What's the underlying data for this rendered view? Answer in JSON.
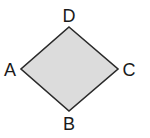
{
  "figure": {
    "shape": "rhombus",
    "fill_color": "#dcdcdc",
    "stroke_color": "#2a2a2a",
    "vertices": {
      "D": {
        "label": "D",
        "x": 69,
        "y": 27
      },
      "C": {
        "label": "C",
        "x": 118,
        "y": 69
      },
      "B": {
        "label": "B",
        "x": 69,
        "y": 111
      },
      "A": {
        "label": "A",
        "x": 21,
        "y": 69
      }
    },
    "labels": {
      "A": "A",
      "B": "B",
      "C": "C",
      "D": "D"
    }
  }
}
